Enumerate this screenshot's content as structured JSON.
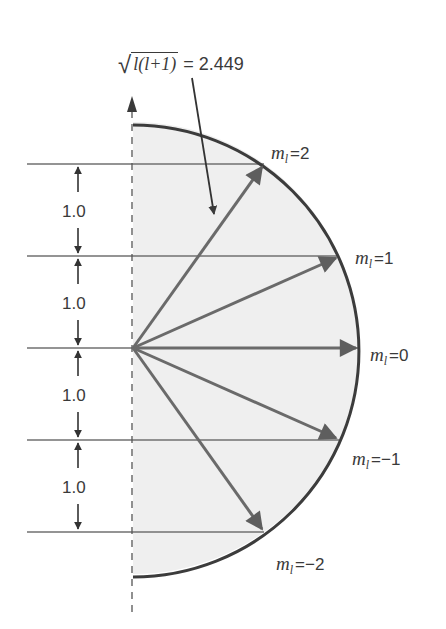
{
  "diagram": {
    "title_formula": {
      "radicand": "l(l+1)",
      "value_text": "= 2.449",
      "label": "|L| magnitude"
    },
    "geometry": {
      "center": [
        133,
        348
      ],
      "radius": 226,
      "unit_px": 92
    },
    "levels": [
      {
        "m": 2,
        "label_prefix": "m",
        "label_sub": "l",
        "label_value": "=2"
      },
      {
        "m": 1,
        "label_prefix": "m",
        "label_sub": "l",
        "label_value": "=1"
      },
      {
        "m": 0,
        "label_prefix": "m",
        "label_sub": "l",
        "label_value": "=0"
      },
      {
        "m": -1,
        "label_prefix": "m",
        "label_sub": "l",
        "label_value": "=−1"
      },
      {
        "m": -2,
        "label_prefix": "m",
        "label_sub": "l",
        "label_value": "=−2"
      }
    ],
    "spacing_labels": [
      "1.0",
      "1.0",
      "1.0",
      "1.0"
    ],
    "colors": {
      "shading": "#efefef",
      "arc": "#3c3c3c",
      "vector": "#6a6a6a",
      "lines": "#707070",
      "text": "#3a3a3a"
    }
  }
}
